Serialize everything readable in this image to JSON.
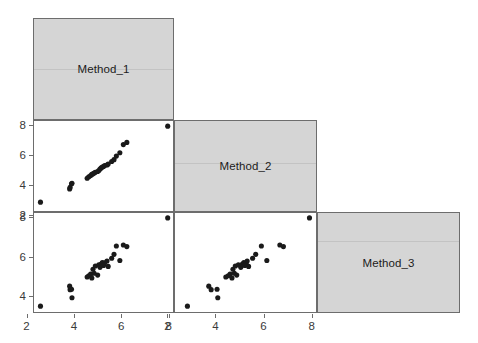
{
  "figure": {
    "type": "scatterplot-matrix",
    "layout": "lower-triangular",
    "variables": [
      "Method_1",
      "Method_2",
      "Method_3"
    ],
    "diagonal_labels": {
      "d1": "Method_1",
      "d2": "Method_2",
      "d3": "Method_3"
    },
    "colors": {
      "diagonal_fill": "#d5d5d5",
      "panel_border": "#6d6d6d",
      "point": "#1a1a1a",
      "panel_background": "#ffffff",
      "tick_text": "#3a3a3a"
    }
  },
  "axes": {
    "col1_x_ticks": [
      "2",
      "4",
      "6",
      "8"
    ],
    "col2_x_ticks": [
      "2",
      "4",
      "6",
      "8"
    ],
    "row2_y_ticks": [
      "8",
      "6",
      "4",
      "2"
    ],
    "row3_y_ticks": [
      "8",
      "6",
      "4"
    ],
    "x_range": [
      2,
      8
    ],
    "y_range_row2": [
      2,
      8
    ],
    "y_range_row3": [
      3.2,
      8.2
    ]
  },
  "chart_data": {
    "type": "scatter",
    "title": "",
    "xlabel": "",
    "ylabel": "",
    "grid": false,
    "legend": "none",
    "variables": [
      "Method_1",
      "Method_2",
      "Method_3"
    ],
    "n_points": 28,
    "axis_ranges": {
      "Method_1": [
        2.4,
        8.1
      ],
      "Method_2": [
        2.4,
        8.1
      ],
      "Method_3": [
        3.3,
        8.1
      ]
    },
    "points": [
      {
        "Method_1": 2.55,
        "Method_2": 2.8,
        "Method_3": 3.45
      },
      {
        "Method_1": 3.8,
        "Method_2": 3.7,
        "Method_3": 4.48
      },
      {
        "Method_1": 3.82,
        "Method_2": 3.8,
        "Method_3": 4.3
      },
      {
        "Method_1": 3.88,
        "Method_2": 4.05,
        "Method_3": 4.32
      },
      {
        "Method_1": 3.9,
        "Method_2": 4.08,
        "Method_3": 3.88
      },
      {
        "Method_1": 4.55,
        "Method_2": 4.42,
        "Method_3": 4.95
      },
      {
        "Method_1": 4.62,
        "Method_2": 4.52,
        "Method_3": 5.02
      },
      {
        "Method_1": 4.7,
        "Method_2": 4.6,
        "Method_3": 5.1
      },
      {
        "Method_1": 4.75,
        "Method_2": 4.68,
        "Method_3": 4.9
      },
      {
        "Method_1": 4.8,
        "Method_2": 4.72,
        "Method_3": 5.35
      },
      {
        "Method_1": 4.85,
        "Method_2": 4.78,
        "Method_3": 5.15
      },
      {
        "Method_1": 4.9,
        "Method_2": 4.82,
        "Method_3": 5.52
      },
      {
        "Method_1": 5.0,
        "Method_2": 4.88,
        "Method_3": 5.05
      },
      {
        "Method_1": 5.05,
        "Method_2": 4.95,
        "Method_3": 5.58
      },
      {
        "Method_1": 5.1,
        "Method_2": 5.05,
        "Method_3": 5.45
      },
      {
        "Method_1": 5.15,
        "Method_2": 5.12,
        "Method_3": 5.62
      },
      {
        "Method_1": 5.2,
        "Method_2": 5.18,
        "Method_3": 5.7
      },
      {
        "Method_1": 5.25,
        "Method_2": 5.22,
        "Method_3": 5.55
      },
      {
        "Method_1": 5.3,
        "Method_2": 5.28,
        "Method_3": 5.68
      },
      {
        "Method_1": 5.4,
        "Method_2": 5.32,
        "Method_3": 5.78
      },
      {
        "Method_1": 5.45,
        "Method_2": 5.38,
        "Method_3": 5.5
      },
      {
        "Method_1": 5.6,
        "Method_2": 5.55,
        "Method_3": 5.92
      },
      {
        "Method_1": 5.7,
        "Method_2": 5.68,
        "Method_3": 6.12
      },
      {
        "Method_1": 5.8,
        "Method_2": 5.92,
        "Method_3": 6.55
      },
      {
        "Method_1": 5.95,
        "Method_2": 6.15,
        "Method_3": 5.8
      },
      {
        "Method_1": 6.1,
        "Method_2": 6.7,
        "Method_3": 6.6
      },
      {
        "Method_1": 6.25,
        "Method_2": 6.85,
        "Method_3": 6.52
      },
      {
        "Method_1": 8.0,
        "Method_2": 7.95,
        "Method_3": 8.0
      }
    ]
  }
}
